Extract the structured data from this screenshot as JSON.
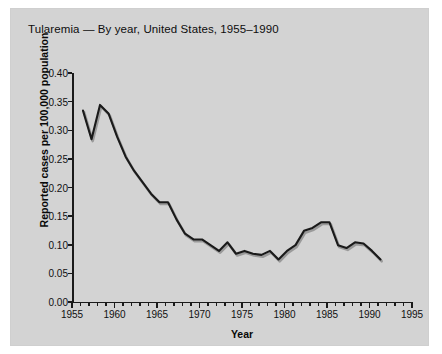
{
  "chart_data": {
    "type": "line",
    "title": "Tularemia — By year, United States, 1955–1990",
    "xlabel": "Year",
    "ylabel": "Reported cases per 100,000 population",
    "xlim": [
      1955,
      1995
    ],
    "ylim": [
      0.0,
      0.4
    ],
    "grid": false,
    "legend": "none",
    "y_ticks": [
      "0.00",
      "0.05",
      "0.10",
      "0.15",
      "0.20",
      "0.25",
      "0.30",
      "0.35",
      "0.40"
    ],
    "y_tick_values": [
      0.0,
      0.05,
      0.1,
      0.15,
      0.2,
      0.25,
      0.3,
      0.35,
      0.4
    ],
    "x_ticks": [
      "1955",
      "1960",
      "1965",
      "1970",
      "1975",
      "1980",
      "1985",
      "1990",
      "1995"
    ],
    "x_tick_values": [
      1955,
      1960,
      1965,
      1970,
      1975,
      1980,
      1985,
      1990,
      1995
    ],
    "x_minor_tick_step": 1,
    "line_color": "#1a1a1a",
    "series": [
      {
        "name": "Tularemia incidence",
        "x": [
          1955,
          1956,
          1957,
          1958,
          1959,
          1960,
          1961,
          1962,
          1963,
          1964,
          1965,
          1966,
          1967,
          1968,
          1969,
          1970,
          1971,
          1972,
          1973,
          1974,
          1975,
          1976,
          1977,
          1978,
          1979,
          1980,
          1981,
          1982,
          1983,
          1984,
          1985,
          1986,
          1987,
          1988,
          1989,
          1990
        ],
        "values": [
          0.35,
          0.3,
          0.36,
          0.345,
          0.305,
          0.27,
          0.245,
          0.225,
          0.205,
          0.19,
          0.19,
          0.16,
          0.135,
          0.125,
          0.125,
          0.115,
          0.105,
          0.12,
          0.1,
          0.105,
          0.1,
          0.098,
          0.105,
          0.09,
          0.105,
          0.115,
          0.14,
          0.145,
          0.155,
          0.155,
          0.115,
          0.11,
          0.12,
          0.118,
          0.105,
          0.09
        ]
      }
    ]
  },
  "figure": {
    "background_color": "#d3d3d3",
    "page_color": "#ffffff"
  }
}
